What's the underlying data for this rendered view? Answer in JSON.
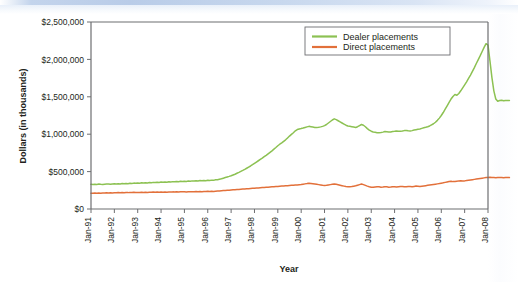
{
  "figure": {
    "background_color": "#ffffff",
    "top_band_color": "#bdd0e9"
  },
  "chart_data": {
    "type": "line",
    "title": "",
    "xlabel": "Year",
    "ylabel": "Dollars (in thousands)",
    "xlim": [
      "Jan-91",
      "Jan-08"
    ],
    "ylim": [
      0,
      2500000
    ],
    "yticks": [
      0,
      500000,
      1000000,
      1500000,
      2000000,
      2500000
    ],
    "ytick_labels": [
      "$0",
      "$500,000",
      "$1,000,000",
      "$1,500,000",
      "$2,000,000",
      "$2,500,000"
    ],
    "xtick_labels": [
      "Jan-91",
      "Jan-92",
      "Jan-93",
      "Jan-94",
      "Jan-95",
      "Jan-96",
      "Jan-97",
      "Jan-98",
      "Jan-99",
      "Jan-00",
      "Jan-01",
      "Jan-02",
      "Jan-03",
      "Jan-04",
      "Jan-05",
      "Jan-06",
      "Jan-07",
      "Jan-08"
    ],
    "grid": false,
    "legend_position": "top-center-right",
    "legend_entries": [
      "Dealer placements",
      "Direct placements"
    ],
    "series": [
      {
        "name": "Dealer placements",
        "color": "#8CC152",
        "values": [
          330000,
          327000,
          331000,
          329000,
          333000,
          330000,
          328000,
          332000,
          335000,
          333000,
          330000,
          334000,
          336000,
          333000,
          338000,
          335000,
          340000,
          337000,
          342000,
          339000,
          344000,
          341000,
          346000,
          343000,
          348000,
          345000,
          350000,
          347000,
          352000,
          349000,
          354000,
          351000,
          356000,
          353000,
          358000,
          355000,
          360000,
          357000,
          362000,
          359000,
          364000,
          361000,
          366000,
          363000,
          368000,
          365000,
          370000,
          367000,
          372000,
          369000,
          374000,
          371000,
          376000,
          373000,
          378000,
          375000,
          380000,
          377000,
          382000,
          379000,
          384000,
          381000,
          386000,
          383000,
          390000,
          392000,
          398000,
          404000,
          412000,
          420000,
          428000,
          436000,
          445000,
          455000,
          465000,
          478000,
          490000,
          503000,
          516000,
          530000,
          545000,
          560000,
          575000,
          592000,
          610000,
          628000,
          645000,
          663000,
          680000,
          700000,
          718000,
          738000,
          758000,
          778000,
          800000,
          822000,
          845000,
          866000,
          885000,
          905000,
          925000,
          950000,
          975000,
          998000,
          1020000,
          1045000,
          1062000,
          1070000,
          1075000,
          1082000,
          1090000,
          1098000,
          1105000,
          1100000,
          1095000,
          1090000,
          1088000,
          1092000,
          1098000,
          1105000,
          1115000,
          1130000,
          1150000,
          1170000,
          1190000,
          1205000,
          1195000,
          1180000,
          1165000,
          1150000,
          1135000,
          1120000,
          1110000,
          1105000,
          1100000,
          1095000,
          1090000,
          1100000,
          1115000,
          1130000,
          1120000,
          1100000,
          1075000,
          1055000,
          1040000,
          1030000,
          1025000,
          1020000,
          1018000,
          1022000,
          1028000,
          1035000,
          1032000,
          1028000,
          1030000,
          1035000,
          1038000,
          1042000,
          1040000,
          1038000,
          1042000,
          1048000,
          1050000,
          1045000,
          1042000,
          1048000,
          1055000,
          1060000,
          1065000,
          1070000,
          1078000,
          1085000,
          1092000,
          1100000,
          1110000,
          1125000,
          1140000,
          1160000,
          1185000,
          1215000,
          1250000,
          1290000,
          1335000,
          1380000,
          1425000,
          1470000,
          1505000,
          1530000,
          1520000,
          1545000,
          1580000,
          1620000,
          1660000,
          1700000,
          1745000,
          1790000,
          1840000,
          1890000,
          1945000,
          1998000,
          2050000,
          2105000,
          2160000,
          2210000,
          2190000,
          1980000,
          1760000,
          1580000,
          1470000,
          1440000,
          1450000,
          1455000,
          1448000,
          1452000,
          1450000,
          1450000
        ]
      },
      {
        "name": "Direct placements",
        "color": "#E2703A",
        "values": [
          212000,
          210000,
          213000,
          211000,
          214000,
          212000,
          215000,
          213000,
          216000,
          214000,
          217000,
          215000,
          218000,
          216000,
          219000,
          217000,
          220000,
          218000,
          221000,
          219000,
          222000,
          220000,
          223000,
          221000,
          222000,
          220000,
          223000,
          221000,
          224000,
          222000,
          225000,
          223000,
          226000,
          224000,
          227000,
          225000,
          226000,
          224000,
          227000,
          225000,
          228000,
          226000,
          229000,
          227000,
          230000,
          228000,
          231000,
          229000,
          230000,
          228000,
          231000,
          229000,
          232000,
          230000,
          233000,
          231000,
          234000,
          232000,
          235000,
          233000,
          236000,
          234000,
          237000,
          235000,
          238000,
          240000,
          242000,
          244000,
          246000,
          248000,
          250000,
          252000,
          254000,
          256000,
          258000,
          260000,
          262000,
          264000,
          266000,
          268000,
          270000,
          272000,
          274000,
          276000,
          278000,
          280000,
          282000,
          284000,
          286000,
          288000,
          290000,
          292000,
          294000,
          296000,
          298000,
          300000,
          302000,
          304000,
          306000,
          308000,
          310000,
          312000,
          314000,
          316000,
          318000,
          320000,
          322000,
          325000,
          328000,
          332000,
          336000,
          340000,
          345000,
          342000,
          338000,
          334000,
          330000,
          326000,
          322000,
          318000,
          315000,
          318000,
          322000,
          326000,
          330000,
          334000,
          330000,
          324000,
          318000,
          312000,
          306000,
          300000,
          298000,
          296000,
          300000,
          305000,
          310000,
          318000,
          326000,
          334000,
          326000,
          316000,
          306000,
          298000,
          292000,
          290000,
          294000,
          298000,
          296000,
          292000,
          294000,
          298000,
          296000,
          292000,
          294000,
          298000,
          296000,
          294000,
          298000,
          302000,
          300000,
          296000,
          298000,
          302000,
          300000,
          298000,
          302000,
          306000,
          304000,
          300000,
          304000,
          308000,
          312000,
          316000,
          320000,
          324000,
          328000,
          332000,
          336000,
          340000,
          345000,
          350000,
          356000,
          362000,
          368000,
          370000,
          366000,
          368000,
          372000,
          376000,
          378000,
          374000,
          376000,
          380000,
          384000,
          388000,
          392000,
          396000,
          400000,
          404000,
          408000,
          412000,
          416000,
          420000,
          422000,
          424000,
          422000,
          420000,
          418000,
          420000,
          422000,
          420000,
          418000,
          420000,
          422000,
          420000
        ]
      }
    ]
  },
  "legend": {
    "items": [
      {
        "label": "Dealer placements",
        "color": "#8CC152"
      },
      {
        "label": "Direct placements",
        "color": "#E2703A"
      }
    ]
  },
  "axes": {
    "y_title": "Dollars (in thousands)",
    "x_title": "Year"
  }
}
